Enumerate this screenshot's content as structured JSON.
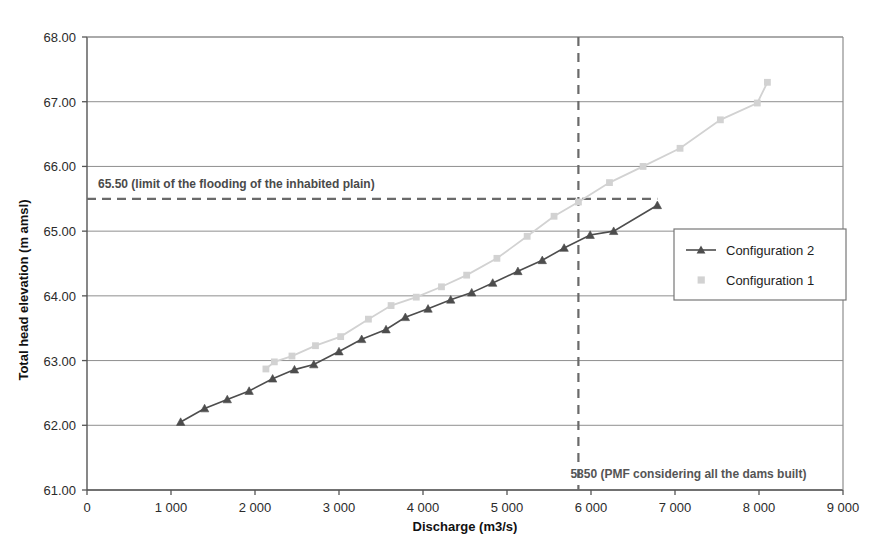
{
  "chart_data": {
    "type": "line",
    "title": "",
    "xlabel": "Discharge (m3/s)",
    "ylabel": "Total head elevation (m amsl)",
    "xlim": [
      0,
      9000
    ],
    "ylim": [
      61.0,
      68.0
    ],
    "grid": true,
    "legend_position": "right-inside",
    "x_ticks": [
      "0",
      "1 000",
      "2 000",
      "3 000",
      "4 000",
      "5 000",
      "6 000",
      "7 000",
      "8 000",
      "9 000"
    ],
    "x_tick_values": [
      0,
      1000,
      2000,
      3000,
      4000,
      5000,
      6000,
      7000,
      8000,
      9000
    ],
    "y_ticks": [
      "61.00",
      "62.00",
      "63.00",
      "64.00",
      "65.00",
      "66.00",
      "67.00",
      "68.00"
    ],
    "y_tick_values": [
      61.0,
      62.0,
      63.0,
      64.0,
      65.0,
      66.0,
      67.0,
      68.0
    ],
    "series": [
      {
        "name": "Configuration 2",
        "color": "#4d4d4d",
        "marker": "triangle",
        "points": [
          {
            "x": 1115,
            "y": 62.05
          },
          {
            "x": 1400,
            "y": 62.26
          },
          {
            "x": 1670,
            "y": 62.4
          },
          {
            "x": 1930,
            "y": 62.53
          },
          {
            "x": 2210,
            "y": 62.72
          },
          {
            "x": 2470,
            "y": 62.86
          },
          {
            "x": 2700,
            "y": 62.94
          },
          {
            "x": 3000,
            "y": 63.14
          },
          {
            "x": 3270,
            "y": 63.33
          },
          {
            "x": 3560,
            "y": 63.48
          },
          {
            "x": 3790,
            "y": 63.67
          },
          {
            "x": 4060,
            "y": 63.8
          },
          {
            "x": 4330,
            "y": 63.94
          },
          {
            "x": 4580,
            "y": 64.05
          },
          {
            "x": 4830,
            "y": 64.2
          },
          {
            "x": 5130,
            "y": 64.38
          },
          {
            "x": 5420,
            "y": 64.55
          },
          {
            "x": 5680,
            "y": 64.74
          },
          {
            "x": 5990,
            "y": 64.94
          },
          {
            "x": 6270,
            "y": 65.0
          },
          {
            "x": 6790,
            "y": 65.4
          }
        ]
      },
      {
        "name": "Configuration 1",
        "color": "#d2d2d2",
        "marker": "square",
        "points": [
          {
            "x": 2130,
            "y": 62.87
          },
          {
            "x": 2230,
            "y": 62.98
          },
          {
            "x": 2440,
            "y": 63.07
          },
          {
            "x": 2720,
            "y": 63.23
          },
          {
            "x": 3020,
            "y": 63.37
          },
          {
            "x": 3350,
            "y": 63.64
          },
          {
            "x": 3620,
            "y": 63.85
          },
          {
            "x": 3920,
            "y": 63.98
          },
          {
            "x": 4220,
            "y": 64.14
          },
          {
            "x": 4520,
            "y": 64.32
          },
          {
            "x": 4880,
            "y": 64.58
          },
          {
            "x": 5240,
            "y": 64.92
          },
          {
            "x": 5560,
            "y": 65.23
          },
          {
            "x": 5850,
            "y": 65.45
          },
          {
            "x": 6220,
            "y": 65.75
          },
          {
            "x": 6620,
            "y": 66.0
          },
          {
            "x": 7060,
            "y": 66.28
          },
          {
            "x": 7540,
            "y": 66.72
          },
          {
            "x": 7980,
            "y": 66.98
          },
          {
            "x": 8100,
            "y": 67.3
          }
        ]
      }
    ],
    "annotations": [
      {
        "id": "flood-limit",
        "text": "65.50 (limit of the flooding of the inhabited plain)",
        "type": "horizontal-dashed-line",
        "value": 65.5,
        "x_start": 0,
        "x_end": 6790
      },
      {
        "id": "pmf-line",
        "text": "5850 (PMF considering all the dams built)",
        "type": "vertical-dashed-line",
        "value": 5850
      }
    ]
  },
  "legend": {
    "items": [
      {
        "label": "Configuration 2",
        "color": "#4d4d4d",
        "marker": "triangle"
      },
      {
        "label": "Configuration 1",
        "color": "#d2d2d2",
        "marker": "square"
      }
    ]
  }
}
